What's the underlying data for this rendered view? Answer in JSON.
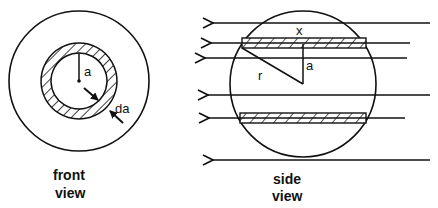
{
  "front_view": {
    "caption_line1": "front",
    "caption_line2": "view",
    "radius_label": "a",
    "thickness_label": "da"
  },
  "side_view": {
    "caption_line1": "side",
    "caption_line2": "view",
    "chord_label": "x",
    "radius_label": "r",
    "height_label": "a"
  },
  "colors": {
    "stroke": "#111111",
    "background": "#ffffff"
  }
}
